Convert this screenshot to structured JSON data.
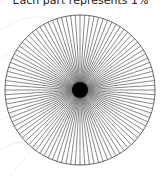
{
  "title": "Each part represents 1%",
  "diagram": {
    "type": "fraction-circle",
    "parts": 100,
    "center": [
      80,
      90
    ],
    "radius": 75,
    "line_color": "#555555",
    "center_color": "#000000",
    "center_radius": 8
  }
}
